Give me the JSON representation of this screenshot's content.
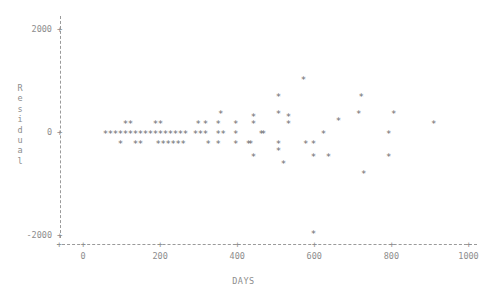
{
  "chart_data": {
    "type": "scatter",
    "title": "",
    "xlabel": "DAYS",
    "ylabel": "Residual",
    "ylabel_chars": [
      "R",
      "e",
      "s",
      "i",
      "d",
      "u",
      "a",
      "l"
    ],
    "marker": "*",
    "marker_color": "#6b6b6b",
    "axis_color": "#9a9a9a",
    "grid": false,
    "legend": null,
    "xlim": [
      -55,
      1060
    ],
    "ylim": [
      -2300,
      2250
    ],
    "xticks": [
      0,
      200,
      400,
      600,
      800,
      1000
    ],
    "xtick_labels": [
      "0",
      "200",
      "400",
      "600",
      "800",
      "1000"
    ],
    "yticks": [
      2000,
      0,
      -2000
    ],
    "ytick_labels": [
      "2000",
      "0",
      "-2000"
    ],
    "points": [
      {
        "x": 58,
        "y": 0
      },
      {
        "x": 71,
        "y": 0
      },
      {
        "x": 84,
        "y": 0
      },
      {
        "x": 97,
        "y": 0
      },
      {
        "x": 97,
        "y": -195
      },
      {
        "x": 110,
        "y": 0
      },
      {
        "x": 110,
        "y": 195
      },
      {
        "x": 123,
        "y": 0
      },
      {
        "x": 123,
        "y": 195
      },
      {
        "x": 136,
        "y": 0
      },
      {
        "x": 136,
        "y": -195
      },
      {
        "x": 149,
        "y": 0
      },
      {
        "x": 149,
        "y": -195
      },
      {
        "x": 162,
        "y": 0
      },
      {
        "x": 175,
        "y": 0
      },
      {
        "x": 188,
        "y": 0
      },
      {
        "x": 188,
        "y": 195
      },
      {
        "x": 195,
        "y": -195
      },
      {
        "x": 201,
        "y": 0
      },
      {
        "x": 201,
        "y": 195
      },
      {
        "x": 208,
        "y": -195
      },
      {
        "x": 214,
        "y": 0
      },
      {
        "x": 221,
        "y": -195
      },
      {
        "x": 227,
        "y": 0
      },
      {
        "x": 234,
        "y": -195
      },
      {
        "x": 240,
        "y": 0
      },
      {
        "x": 247,
        "y": -195
      },
      {
        "x": 253,
        "y": 0
      },
      {
        "x": 260,
        "y": -195
      },
      {
        "x": 266,
        "y": 0
      },
      {
        "x": 292,
        "y": 0
      },
      {
        "x": 299,
        "y": 195
      },
      {
        "x": 305,
        "y": 0
      },
      {
        "x": 318,
        "y": 0
      },
      {
        "x": 318,
        "y": 195
      },
      {
        "x": 325,
        "y": -195
      },
      {
        "x": 351,
        "y": 195
      },
      {
        "x": 351,
        "y": 0
      },
      {
        "x": 351,
        "y": -195
      },
      {
        "x": 357,
        "y": 390
      },
      {
        "x": 364,
        "y": 0
      },
      {
        "x": 396,
        "y": 195
      },
      {
        "x": 396,
        "y": 0
      },
      {
        "x": 396,
        "y": -195
      },
      {
        "x": 429,
        "y": -195
      },
      {
        "x": 435,
        "y": -195
      },
      {
        "x": 442,
        "y": 195
      },
      {
        "x": 442,
        "y": 325
      },
      {
        "x": 442,
        "y": -455
      },
      {
        "x": 462,
        "y": 0
      },
      {
        "x": 468,
        "y": 0
      },
      {
        "x": 507,
        "y": 715
      },
      {
        "x": 507,
        "y": 390
      },
      {
        "x": 507,
        "y": -195
      },
      {
        "x": 507,
        "y": -325
      },
      {
        "x": 520,
        "y": -585
      },
      {
        "x": 533,
        "y": 325
      },
      {
        "x": 533,
        "y": 195
      },
      {
        "x": 572,
        "y": 1040
      },
      {
        "x": 578,
        "y": -195
      },
      {
        "x": 598,
        "y": -195
      },
      {
        "x": 598,
        "y": -455
      },
      {
        "x": 598,
        "y": -1950
      },
      {
        "x": 624,
        "y": 0
      },
      {
        "x": 637,
        "y": -455
      },
      {
        "x": 663,
        "y": 260
      },
      {
        "x": 715,
        "y": 390
      },
      {
        "x": 722,
        "y": 715
      },
      {
        "x": 728,
        "y": -780
      },
      {
        "x": 793,
        "y": 0
      },
      {
        "x": 793,
        "y": -455
      },
      {
        "x": 806,
        "y": 390
      },
      {
        "x": 910,
        "y": 195
      }
    ]
  }
}
